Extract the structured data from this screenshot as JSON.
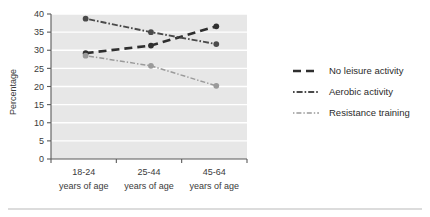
{
  "chart_data": {
    "type": "line",
    "title": "",
    "subtitle": "",
    "xlabel": "",
    "ylabel": "Percentage",
    "categories": [
      "18-24",
      "25-44",
      "45-64"
    ],
    "category_sublabel": "years of age",
    "category_labels_line1": [
      "18-24",
      "25-44",
      "45-64"
    ],
    "category_labels_line2": [
      "years of age",
      "years of age",
      "years of age"
    ],
    "ylim": [
      0,
      40
    ],
    "yticks": [
      0,
      5,
      10,
      15,
      20,
      25,
      30,
      35,
      40
    ],
    "ytick_labels": [
      "0",
      "5",
      "10",
      "15",
      "20",
      "25",
      "30",
      "35",
      "40"
    ],
    "grid": true,
    "grid_axis": "y",
    "legend_position": "right",
    "series": [
      {
        "name": "No leisure activity",
        "values": [
          29.2,
          31.3,
          36.6
        ],
        "style": "dashed",
        "color": "#2f2f2f",
        "marker": "circle"
      },
      {
        "name": "Aerobic activity",
        "values": [
          38.7,
          35.0,
          31.7
        ],
        "style": "dash-dot",
        "color": "#4a4a4a",
        "marker": "circle"
      },
      {
        "name": "Resistance training",
        "values": [
          28.5,
          25.7,
          20.2
        ],
        "style": "fine-dash-dot",
        "color": "#9a9a9a",
        "marker": "circle"
      }
    ]
  },
  "legend": {
    "items": [
      {
        "label": "No leisure activity"
      },
      {
        "label": "Aerobic activity"
      },
      {
        "label": "Resistance training"
      }
    ]
  },
  "colors": {
    "plot_background": "#e7e7e7",
    "gridline": "#ffffff",
    "axis": "#5a5a5a",
    "series_no_leisure": "#2f2f2f",
    "series_aerobic": "#4a4a4a",
    "series_resistance": "#9a9a9a",
    "page_background": "#ffffff",
    "footer_rule": "#b9b9b9"
  }
}
